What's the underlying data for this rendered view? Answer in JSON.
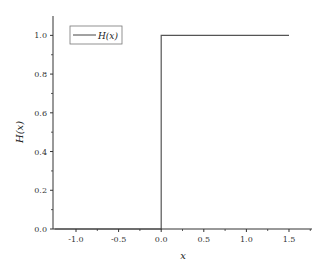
{
  "chart_data": {
    "type": "line",
    "title": "",
    "xlabel": "x",
    "ylabel": "H(x)",
    "xlim": [
      -1.27,
      1.77
    ],
    "ylim": [
      0,
      1.1
    ],
    "grid": false,
    "legend_position": "upper-left",
    "x_ticks": [
      -1.0,
      -0.5,
      0.0,
      0.5,
      1.0,
      1.5
    ],
    "x_tick_labels": [
      "-1.0",
      "-0.5",
      "0.0",
      "0.5",
      "1.0",
      "1.5"
    ],
    "y_ticks": [
      0.0,
      0.2,
      0.4,
      0.6,
      0.8,
      1.0
    ],
    "y_tick_labels": [
      "0.0",
      "0.2",
      "0.4",
      "0.6",
      "0.8",
      "1.0"
    ],
    "series": [
      {
        "name": "H(x)",
        "color": "#555555",
        "x": [
          -1.25,
          0.0,
          0.0,
          1.5
        ],
        "y": [
          0.0,
          0.0,
          1.0,
          1.0
        ]
      }
    ]
  },
  "legend": {
    "label": "H(x)"
  },
  "axes": {
    "xlabel": "x",
    "ylabel": "H(x)"
  }
}
